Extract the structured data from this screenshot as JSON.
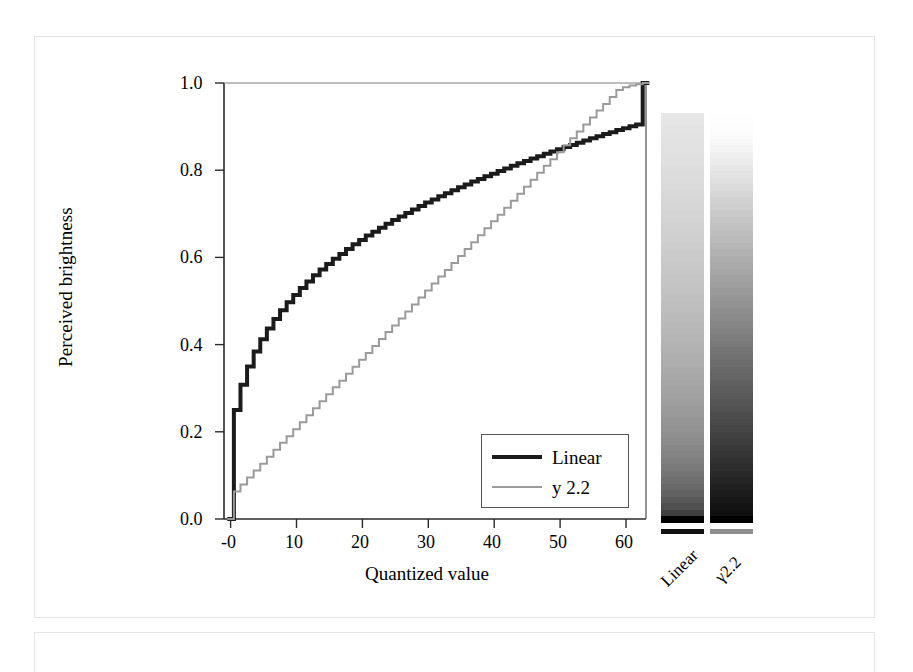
{
  "figure": {
    "panel_label": "",
    "axis": {
      "xlabel": "Quantized value",
      "ylabel": "Perceived brightness",
      "xticks": [
        "-0",
        "10",
        "20",
        "30",
        "40",
        "50",
        "60"
      ],
      "yticks": [
        "0.0",
        "0.2",
        "0.4",
        "0.6",
        "0.8",
        "1.0"
      ]
    },
    "legend": {
      "items": [
        {
          "label": "Linear",
          "color": "#1b1b1b",
          "style": "thick"
        },
        {
          "label": "y 2.2",
          "color": "#9a9a9a",
          "style": "thin"
        }
      ]
    },
    "gradient_bars": {
      "captions": [
        "Linear",
        "γ2.2"
      ],
      "top_color": "#ffffff",
      "bottom_color": "#000000",
      "underline_colors": [
        "#111111",
        "#8d8d8d"
      ]
    }
  },
  "chart_data": {
    "type": "line",
    "title": "",
    "subtitle": "",
    "xlabel": "Quantized value",
    "ylabel": "Perceived brightness",
    "xlim": [
      -1,
      63
    ],
    "ylim": [
      0.0,
      1.0
    ],
    "xticks": [
      0,
      10,
      20,
      30,
      40,
      50,
      60
    ],
    "yticks": [
      0.0,
      0.2,
      0.4,
      0.6,
      0.8,
      1.0
    ],
    "grid": false,
    "legend_position": "lower-right",
    "step_style": "staircase",
    "levels": 64,
    "x": [
      0,
      1,
      2,
      3,
      4,
      5,
      6,
      7,
      8,
      9,
      10,
      11,
      12,
      13,
      14,
      15,
      16,
      17,
      18,
      19,
      20,
      21,
      22,
      23,
      24,
      25,
      26,
      27,
      28,
      29,
      30,
      31,
      32,
      33,
      34,
      35,
      36,
      37,
      38,
      39,
      40,
      41,
      42,
      43,
      44,
      45,
      46,
      47,
      48,
      49,
      50,
      51,
      52,
      53,
      54,
      55,
      56,
      57,
      58,
      59,
      60,
      61,
      62,
      63
    ],
    "series": [
      {
        "name": "Linear",
        "color": "#1b1b1b",
        "width": 4,
        "description": "Perceived brightness of a linearly quantized ramp; rises steeply at low codes then flattens (approx. v^(1/2.2)).",
        "values": [
          0.0,
          0.25,
          0.308,
          0.35,
          0.384,
          0.412,
          0.437,
          0.459,
          0.479,
          0.497,
          0.514,
          0.53,
          0.545,
          0.559,
          0.572,
          0.585,
          0.597,
          0.608,
          0.619,
          0.63,
          0.64,
          0.65,
          0.659,
          0.668,
          0.677,
          0.686,
          0.694,
          0.702,
          0.71,
          0.718,
          0.726,
          0.733,
          0.74,
          0.747,
          0.754,
          0.761,
          0.767,
          0.774,
          0.78,
          0.786,
          0.792,
          0.798,
          0.804,
          0.81,
          0.816,
          0.821,
          0.827,
          0.832,
          0.838,
          0.843,
          0.848,
          0.853,
          0.858,
          0.863,
          0.868,
          0.873,
          0.878,
          0.883,
          0.887,
          0.892,
          0.896,
          0.901,
          0.905,
          1.0
        ]
      },
      {
        "name": "y 2.2",
        "color": "#9a9a9a",
        "width": 2,
        "description": "Perceived brightness of a gamma-2.2 encoded quantized ramp; approximately linear in perceptual space.",
        "values": [
          0.0,
          0.063,
          0.079,
          0.095,
          0.111,
          0.127,
          0.143,
          0.159,
          0.175,
          0.19,
          0.206,
          0.222,
          0.238,
          0.254,
          0.27,
          0.286,
          0.302,
          0.317,
          0.333,
          0.349,
          0.365,
          0.381,
          0.397,
          0.413,
          0.429,
          0.444,
          0.46,
          0.476,
          0.492,
          0.508,
          0.524,
          0.54,
          0.556,
          0.571,
          0.587,
          0.603,
          0.619,
          0.635,
          0.651,
          0.667,
          0.683,
          0.698,
          0.714,
          0.73,
          0.746,
          0.762,
          0.778,
          0.794,
          0.81,
          0.825,
          0.841,
          0.857,
          0.873,
          0.889,
          0.905,
          0.921,
          0.937,
          0.952,
          0.968,
          0.984,
          0.99,
          0.994,
          0.997,
          1.0
        ]
      }
    ]
  }
}
